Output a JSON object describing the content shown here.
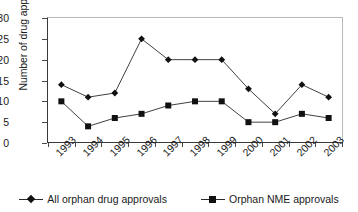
{
  "chart_data": {
    "type": "line",
    "title": "",
    "xlabel": "",
    "ylabel": "Number of drug approvals",
    "categories": [
      "1993",
      "1994",
      "1995",
      "1996",
      "1997",
      "1998",
      "1999",
      "2000",
      "2001",
      "2002",
      "2003"
    ],
    "series": [
      {
        "name": "All orphan drug approvals",
        "marker": "diamond",
        "values": [
          14,
          11,
          12,
          25,
          20,
          20,
          20,
          13,
          7,
          14,
          11
        ]
      },
      {
        "name": "Orphan NME approvals",
        "marker": "square",
        "values": [
          10,
          4,
          6,
          7,
          9,
          10,
          10,
          5,
          5,
          7,
          6
        ]
      }
    ],
    "ylim": [
      0,
      30
    ],
    "yticks": [
      0,
      5,
      10,
      15,
      20,
      25,
      30
    ],
    "grid": false,
    "legend_position": "bottom",
    "colors": {
      "series_line": "#2a2a2a",
      "marker": "#111111",
      "axis": "#3a3a3a",
      "frame": "#b9b9b9",
      "background": "#ffffff"
    }
  },
  "legend": {
    "entries": [
      {
        "label": "All orphan drug approvals",
        "icon": "diamond-marker-icon"
      },
      {
        "label": "Orphan NME approvals",
        "icon": "square-marker-icon"
      }
    ]
  }
}
